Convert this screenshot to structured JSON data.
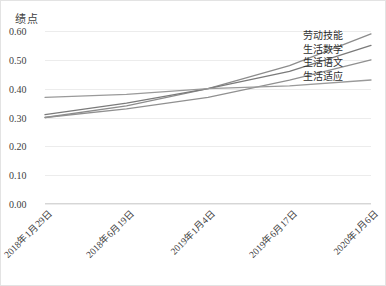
{
  "chart_data": {
    "type": "line",
    "title": "",
    "ylabel": "绩点",
    "xlabel": "",
    "ylim": [
      0.0,
      0.6
    ],
    "grid": true,
    "legend_position": "right-inline-end-of-line",
    "yticks": [
      "0.60",
      "0.50",
      "0.40",
      "0.30",
      "0.20",
      "0.10",
      "0.00"
    ],
    "ytick_values": [
      0.6,
      0.5,
      0.4,
      0.3,
      0.2,
      0.1,
      0.0
    ],
    "categories": [
      "2018年1月29日",
      "2018年6月19日",
      "2019年1月4日",
      "2019年6月17日",
      "2020年1月6日"
    ],
    "series": [
      {
        "name": "劳动技能",
        "color": "#8c8c8c",
        "values": [
          0.3,
          0.34,
          0.4,
          0.48,
          0.59
        ]
      },
      {
        "name": "生活数学",
        "color": "#7a7a7a",
        "values": [
          0.31,
          0.35,
          0.4,
          0.46,
          0.55
        ]
      },
      {
        "name": "生活语文",
        "color": "#909090",
        "values": [
          0.3,
          0.33,
          0.37,
          0.43,
          0.5
        ]
      },
      {
        "name": "生活适应",
        "color": "#9a9a9a",
        "values": [
          0.37,
          0.38,
          0.4,
          0.41,
          0.43
        ]
      }
    ]
  },
  "legend": {
    "items": [
      "劳动技能",
      "生活数学",
      "生活语文",
      "生活适应"
    ]
  }
}
